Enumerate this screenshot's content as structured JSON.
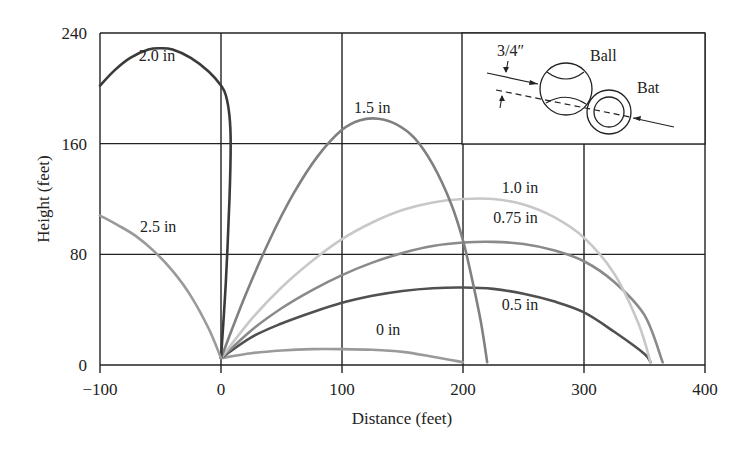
{
  "chart_data": {
    "type": "line",
    "title": "",
    "xlabel": "Distance (feet)",
    "ylabel": "Height (feet)",
    "xlim": [
      -100,
      400
    ],
    "ylim": [
      0,
      240
    ],
    "xticks": [
      -100,
      0,
      100,
      200,
      300,
      400
    ],
    "yticks": [
      0,
      80,
      160,
      240
    ],
    "xtick_labels": [
      "−100",
      "0",
      "100",
      "200",
      "300",
      "400"
    ],
    "ytick_labels": [
      "0",
      "80",
      "160",
      "240"
    ],
    "grid": true,
    "legend": "inline curve labels",
    "series": [
      {
        "name": "0 in",
        "color": "#9a9a9a",
        "label_pos": [
          128,
          22
        ],
        "points": [
          [
            0,
            5
          ],
          [
            25,
            8.5
          ],
          [
            50,
            10.5
          ],
          [
            75,
            11.5
          ],
          [
            100,
            11.5
          ],
          [
            125,
            11
          ],
          [
            150,
            9.5
          ],
          [
            175,
            6
          ],
          [
            200,
            2
          ]
        ]
      },
      {
        "name": "0.5 in",
        "color": "#505050",
        "label_pos": [
          232,
          40
        ],
        "points": [
          [
            0,
            5
          ],
          [
            25,
            20
          ],
          [
            50,
            30
          ],
          [
            75,
            38
          ],
          [
            100,
            45
          ],
          [
            125,
            50
          ],
          [
            150,
            53.5
          ],
          [
            175,
            55.5
          ],
          [
            200,
            56
          ],
          [
            225,
            55
          ],
          [
            250,
            51.5
          ],
          [
            275,
            46
          ],
          [
            300,
            38
          ],
          [
            325,
            24
          ],
          [
            350,
            8
          ],
          [
            355,
            2
          ]
        ]
      },
      {
        "name": "0.75 in",
        "color": "#8a8a8a",
        "label_pos": [
          225,
          103
        ],
        "points": [
          [
            0,
            5
          ],
          [
            25,
            25
          ],
          [
            50,
            41
          ],
          [
            75,
            54
          ],
          [
            100,
            65
          ],
          [
            125,
            74
          ],
          [
            150,
            81
          ],
          [
            175,
            86
          ],
          [
            200,
            88.5
          ],
          [
            225,
            89
          ],
          [
            250,
            87.5
          ],
          [
            275,
            83
          ],
          [
            300,
            75
          ],
          [
            325,
            60
          ],
          [
            350,
            36
          ],
          [
            365,
            2
          ]
        ]
      },
      {
        "name": "1.0 in",
        "color": "#c8c8c8",
        "label_pos": [
          232,
          124
        ],
        "points": [
          [
            0,
            5
          ],
          [
            25,
            33
          ],
          [
            50,
            56
          ],
          [
            75,
            75
          ],
          [
            100,
            91
          ],
          [
            125,
            103
          ],
          [
            150,
            112
          ],
          [
            175,
            117.5
          ],
          [
            200,
            120
          ],
          [
            225,
            120
          ],
          [
            250,
            116
          ],
          [
            275,
            107
          ],
          [
            300,
            92
          ],
          [
            325,
            66
          ],
          [
            345,
            30
          ],
          [
            355,
            2
          ]
        ]
      },
      {
        "name": "1.5 in",
        "color": "#808080",
        "label_pos": [
          110,
          182
        ],
        "points": [
          [
            0,
            5
          ],
          [
            20,
            50
          ],
          [
            40,
            90
          ],
          [
            60,
            124
          ],
          [
            80,
            151
          ],
          [
            100,
            170
          ],
          [
            115,
            177
          ],
          [
            130,
            178
          ],
          [
            145,
            174
          ],
          [
            160,
            164
          ],
          [
            175,
            145
          ],
          [
            190,
            117
          ],
          [
            200,
            90
          ],
          [
            208,
            60
          ],
          [
            215,
            30
          ],
          [
            220,
            2
          ]
        ]
      },
      {
        "name": "2.0 in",
        "color": "#3a3a3a",
        "label_pos": [
          -68,
          220
        ],
        "points": [
          [
            0,
            5
          ],
          [
            4,
            60
          ],
          [
            7,
            120
          ],
          [
            8,
            160
          ],
          [
            7,
            180
          ],
          [
            4,
            195
          ],
          [
            0,
            202
          ],
          [
            -10,
            212
          ],
          [
            -25,
            222
          ],
          [
            -40,
            228
          ],
          [
            -50,
            229
          ],
          [
            -60,
            228
          ],
          [
            -75,
            222
          ],
          [
            -88,
            213
          ],
          [
            -100,
            202
          ]
        ]
      },
      {
        "name": "2.5 in",
        "color": "#9a9a9a",
        "label_pos": [
          -67,
          96
        ],
        "points": [
          [
            0,
            5
          ],
          [
            -10,
            26
          ],
          [
            -25,
            50
          ],
          [
            -40,
            68
          ],
          [
            -55,
            82
          ],
          [
            -70,
            93
          ],
          [
            -85,
            101
          ],
          [
            -100,
            108
          ]
        ]
      }
    ],
    "annotations": [
      {
        "text": "3/4″",
        "type": "inset-dimension"
      },
      {
        "text": "Ball",
        "type": "inset-label"
      },
      {
        "text": "Bat",
        "type": "inset-label"
      }
    ]
  },
  "labels": {
    "xlabel": "Distance (feet)",
    "ylabel": "Height (feet)",
    "inset_offset": "3/4″",
    "inset_ball": "Ball",
    "inset_bat": "Bat"
  }
}
